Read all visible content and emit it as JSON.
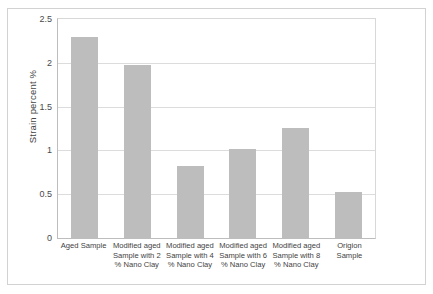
{
  "chart_data": {
    "type": "bar",
    "title": "",
    "xlabel": "",
    "ylabel": "Strain percent  %",
    "categories": [
      "Aged Sample",
      "Modified aged Sample with 2 % Nano Clay",
      "Modified aged Sample with 4 % Nano Clay",
      "Modified aged Sample with 6 % Nano Clay",
      "Modified aged Sample with 8 % Nano Clay",
      "Origion Sample"
    ],
    "values": [
      2.3,
      1.97,
      0.82,
      1.02,
      1.26,
      0.52
    ],
    "ylim": [
      0,
      2.5
    ],
    "ytick_labels": [
      "0",
      "0.5",
      "1",
      "1.5",
      "2",
      "2.5"
    ],
    "ytick_values": [
      0,
      0.5,
      1,
      1.5,
      2,
      2.5
    ],
    "grid": true,
    "legend": false,
    "bar_color": "#bdbdbd",
    "gridline_color": "#dcdcdc",
    "axis_color": "#bdbdbd",
    "frame_color": "#d2d2d2",
    "background": "#ffffff"
  }
}
